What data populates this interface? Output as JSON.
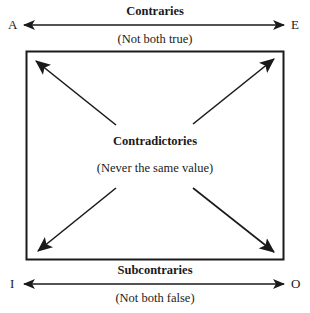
{
  "diagram": {
    "type": "square-of-opposition",
    "corners": {
      "top_left": "A",
      "top_right": "E",
      "bottom_left": "I",
      "bottom_right": "O"
    },
    "relations": {
      "top": {
        "name": "Contraries",
        "description": "(Not both true)"
      },
      "diagonals": {
        "name": "Contradictories",
        "description": "(Never the same value)"
      },
      "bottom": {
        "name": "Subcontraries",
        "description": "(Not both false)"
      }
    },
    "colors": {
      "ink": "#1a1a1a",
      "background": "#ffffff"
    }
  }
}
